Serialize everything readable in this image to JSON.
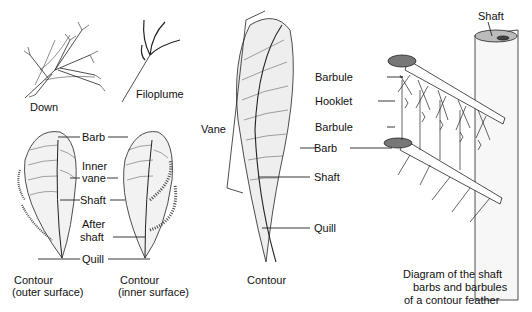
{
  "figures": {
    "down": {
      "caption": "Down"
    },
    "filoplume": {
      "caption": "Filoplume"
    },
    "contour_pair": {
      "labels": {
        "barb": "Barb",
        "inner_vane_1": "Inner",
        "inner_vane_2": "vane",
        "shaft": "Shaft",
        "after_shaft_1": "After",
        "after_shaft_2": "shaft",
        "quill": "Quill"
      },
      "caption_outer_1": "Contour",
      "caption_outer_2": "(outer surface)",
      "caption_inner_1": "Contour",
      "caption_inner_2": "(inner surface)"
    },
    "contour_large": {
      "labels": {
        "vane": "Vane",
        "shaft": "Shaft",
        "quill": "Quill"
      },
      "caption": "Contour"
    },
    "structure": {
      "labels": {
        "shaft": "Shaft",
        "barbule_top": "Barbule",
        "hooklet": "Hooklet",
        "barbule_bottom": "Barbule",
        "barb": "Barb"
      },
      "caption_1": "Diagram of the shaft",
      "caption_2": "barbs and barbules",
      "caption_3": "of a contour feather"
    }
  }
}
